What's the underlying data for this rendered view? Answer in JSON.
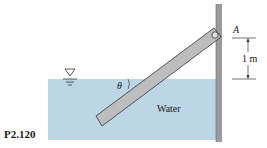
{
  "figure": {
    "id_label": "P2.120",
    "water_label": "Water",
    "hinge_label": "A",
    "dimension_label": "1 m",
    "angle_label": "θ",
    "icons": [
      "free-surface-triangle-icon",
      "hinge-icon"
    ],
    "colors": {
      "water": "#bcd6e6",
      "gate": "#bdbdbd",
      "wall": "#9a9a9a",
      "outline": "#333333"
    }
  }
}
